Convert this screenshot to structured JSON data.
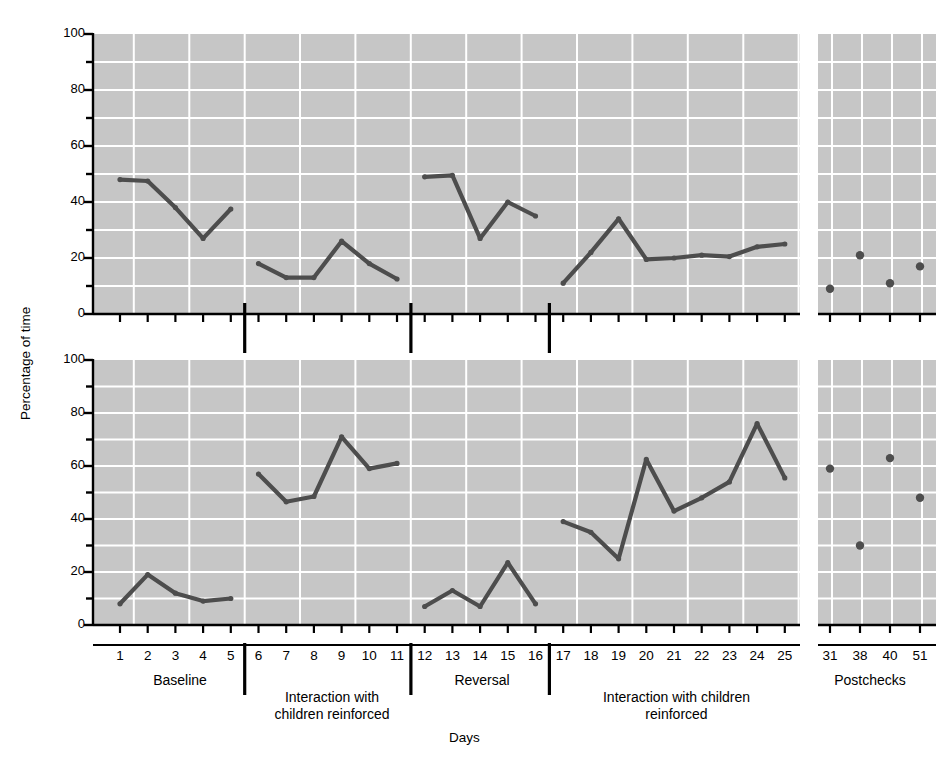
{
  "figure": {
    "axis_titles": {
      "y": "Percentage of time",
      "x": "Days"
    },
    "panels": [
      {
        "key": "adults",
        "title": "With adults"
      },
      {
        "key": "children",
        "title": "With children"
      }
    ],
    "y_ticks": [
      0,
      20,
      40,
      60,
      80,
      100
    ],
    "y_minor_ticks": [
      10,
      30,
      50,
      70,
      90
    ],
    "day_labels": [
      "1",
      "2",
      "3",
      "4",
      "5",
      "6",
      "7",
      "8",
      "9",
      "10",
      "11",
      "12",
      "13",
      "14",
      "15",
      "16",
      "17",
      "18",
      "19",
      "20",
      "21",
      "22",
      "23",
      "24",
      "25"
    ],
    "postcheck_labels": [
      "31",
      "38",
      "40",
      "51"
    ],
    "phases": [
      {
        "label": "Baseline",
        "days": [
          1,
          5
        ]
      },
      {
        "label": "Interaction with\nchildren reinforced",
        "days": [
          6,
          11
        ]
      },
      {
        "label": "Reversal",
        "days": [
          12,
          16
        ]
      },
      {
        "label": "Interaction with children\nreinforced",
        "days": [
          17,
          25
        ]
      },
      {
        "label": "Postchecks",
        "days": []
      }
    ],
    "colors": {
      "plot_background": "#c6c6c6",
      "gridline": "#ffffff",
      "data_line": "#4d4d4d",
      "axis": "#000000",
      "page_background": "#ffffff"
    }
  },
  "chart_data": {
    "type": "line",
    "xlabel": "Days",
    "ylabel": "Percentage of time",
    "ylim": [
      0,
      100
    ],
    "grid": true,
    "legend": "none",
    "panels": [
      {
        "name": "With adults",
        "series": [
          {
            "name": "Baseline",
            "phase": "Baseline",
            "x": [
              1,
              2,
              3,
              4,
              5
            ],
            "y": [
              48,
              47.5,
              38,
              27,
              37.5
            ]
          },
          {
            "name": "Interaction with children reinforced (1)",
            "phase": "Interaction with children reinforced",
            "x": [
              6,
              7,
              8,
              9,
              10,
              11
            ],
            "y": [
              18,
              13,
              13,
              26,
              18,
              12.5
            ]
          },
          {
            "name": "Reversal",
            "phase": "Reversal",
            "x": [
              12,
              13,
              14,
              15,
              16
            ],
            "y": [
              49,
              49.5,
              27,
              40,
              35
            ]
          },
          {
            "name": "Interaction with children reinforced (2)",
            "phase": "Interaction with children reinforced",
            "x": [
              17,
              18,
              19,
              20,
              21,
              22,
              23,
              24,
              25
            ],
            "y": [
              11,
              22,
              34,
              19.5,
              20,
              21,
              20.5,
              24,
              25
            ]
          },
          {
            "name": "Postchecks",
            "phase": "Postchecks",
            "mode": "markers",
            "x": [
              31,
              38,
              40,
              51
            ],
            "y": [
              9,
              21,
              11,
              17
            ]
          }
        ]
      },
      {
        "name": "With children",
        "series": [
          {
            "name": "Baseline",
            "phase": "Baseline",
            "x": [
              1,
              2,
              3,
              4,
              5
            ],
            "y": [
              8,
              19,
              12,
              9,
              10
            ]
          },
          {
            "name": "Interaction with children reinforced (1)",
            "phase": "Interaction with children reinforced",
            "x": [
              6,
              7,
              8,
              9,
              10,
              11
            ],
            "y": [
              57,
              46.5,
              48.5,
              71,
              59,
              61
            ]
          },
          {
            "name": "Reversal",
            "phase": "Reversal",
            "x": [
              12,
              13,
              14,
              15,
              16
            ],
            "y": [
              7,
              13,
              7,
              23.5,
              8
            ]
          },
          {
            "name": "Interaction with children reinforced (2)",
            "phase": "Interaction with children reinforced",
            "x": [
              17,
              18,
              19,
              20,
              21,
              22,
              23,
              24,
              25
            ],
            "y": [
              39,
              35,
              25,
              62.5,
              43,
              48,
              54,
              76,
              55.5
            ]
          },
          {
            "name": "Postchecks",
            "phase": "Postchecks",
            "mode": "markers",
            "x": [
              31,
              38,
              40,
              51
            ],
            "y": [
              59,
              30,
              63,
              48
            ]
          }
        ]
      }
    ]
  }
}
